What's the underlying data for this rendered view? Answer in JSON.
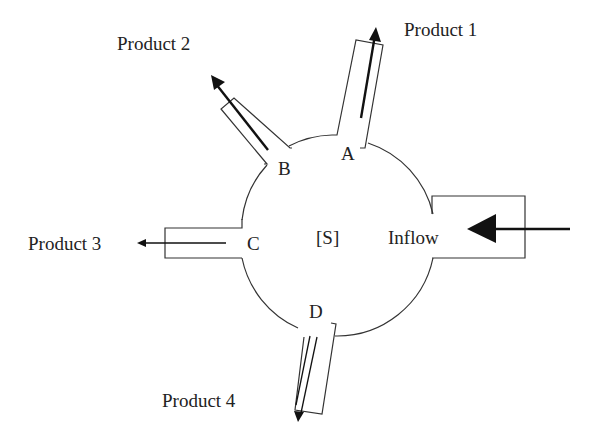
{
  "diagram": {
    "center_label": "[S]",
    "inflow": {
      "label": "Inflow"
    },
    "outlets": [
      {
        "port": "A",
        "product": "Product 1"
      },
      {
        "port": "B",
        "product": "Product 2"
      },
      {
        "port": "C",
        "product": "Product 3"
      },
      {
        "port": "D",
        "product": "Product 4"
      }
    ],
    "colors": {
      "ink": "#222222",
      "arrow": "#111111",
      "background": "#ffffff"
    }
  }
}
